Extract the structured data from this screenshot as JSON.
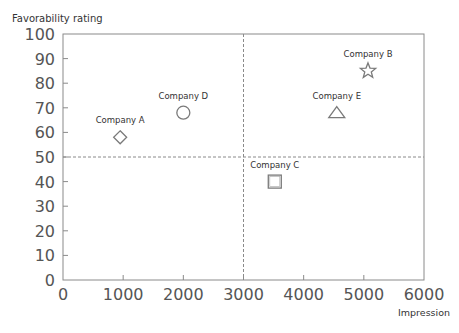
{
  "chart_data": {
    "type": "scatter",
    "title": "",
    "xlabel": "Impression",
    "ylabel": "Favorability rating",
    "xlim": [
      0,
      6000
    ],
    "ylim": [
      0,
      100
    ],
    "xticks": [
      0,
      1000,
      2000,
      3000,
      4000,
      5000,
      6000
    ],
    "yticks": [
      0,
      10,
      20,
      30,
      40,
      50,
      60,
      70,
      80,
      90,
      100
    ],
    "grid": false,
    "legend": null,
    "reference_lines": [
      {
        "axis": "x",
        "value": 3000,
        "style": "dashed"
      },
      {
        "axis": "y",
        "value": 50,
        "style": "dashed"
      }
    ],
    "points": [
      {
        "name": "Company A",
        "x": 950,
        "y": 58,
        "marker": "diamond"
      },
      {
        "name": "Company B",
        "x": 5070,
        "y": 85,
        "marker": "star"
      },
      {
        "name": "Company C",
        "x": 3520,
        "y": 40,
        "marker": "square"
      },
      {
        "name": "Company D",
        "x": 2000,
        "y": 68,
        "marker": "circle"
      },
      {
        "name": "Company E",
        "x": 4550,
        "y": 68,
        "marker": "triangle"
      }
    ]
  },
  "colors": {
    "axis": "#8a8a8a",
    "marker": "#7a7a7a",
    "text": "#555555"
  }
}
